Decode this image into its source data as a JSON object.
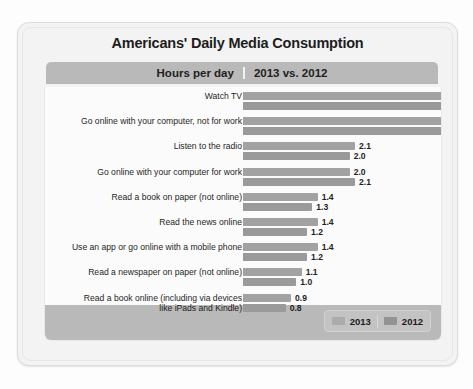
{
  "title": "Americans' Daily Media Consumption",
  "subtitle": {
    "left": "Hours per day",
    "right": "2013 vs. 2012"
  },
  "legend": {
    "series_2013": "2013",
    "series_2012": "2012"
  },
  "chart_data": {
    "type": "bar",
    "orientation": "horizontal",
    "title": "Americans' Daily Media Consumption",
    "subtitle": "Hours per day  |  2013 vs. 2012",
    "xlabel": "Hours per day",
    "ylabel": "",
    "xlim": [
      0,
      3.9
    ],
    "grid": false,
    "legend_position": "bottom-right",
    "categories": [
      "Watch TV",
      "Go online with your computer, not for work",
      "Listen to the radio",
      "Go online with your computer for work",
      "Read a book on paper (not online)",
      "Read the news online",
      "Use an app or go online with a mobile phone",
      "Read a newspaper on paper (not online)",
      "Read a book online (including via devices like iPads and Kindle)"
    ],
    "series": [
      {
        "name": "2013",
        "values": [
          3.9,
          3.8,
          2.1,
          2.0,
          1.4,
          1.4,
          1.4,
          1.1,
          0.9
        ]
      },
      {
        "name": "2012",
        "values": [
          3.9,
          3.8,
          2.0,
          2.1,
          1.3,
          1.2,
          1.2,
          1.0,
          0.8
        ]
      }
    ],
    "value_labels": [
      [
        "3.9",
        "3.9"
      ],
      [
        "3.8",
        "3.8"
      ],
      [
        "2.1",
        "2.0"
      ],
      [
        "2.0",
        "2.1"
      ],
      [
        "1.4",
        "1.3"
      ],
      [
        "1.4",
        "1.2"
      ],
      [
        "1.4",
        "1.2"
      ],
      [
        "1.1",
        "1.0"
      ],
      [
        "0.9",
        "0.8"
      ]
    ]
  },
  "colors": {
    "bar_2013": "#a2a2a2",
    "bar_2012": "#9a9a9a",
    "band": "#b9b9b9",
    "card": "#f3f3f3"
  },
  "rows": [
    {
      "label": "Watch TV",
      "label2": "",
      "v2013": "3.9",
      "v2012": "3.9"
    },
    {
      "label": "Go online with your computer, not for work",
      "label2": "",
      "v2013": "3.8",
      "v2012": "3.8"
    },
    {
      "label": "Listen to the radio",
      "label2": "",
      "v2013": "2.1",
      "v2012": "2.0"
    },
    {
      "label": "Go online with your computer for work",
      "label2": "",
      "v2013": "2.0",
      "v2012": "2.1"
    },
    {
      "label": "Read a book on paper (not online)",
      "label2": "",
      "v2013": "1.4",
      "v2012": "1.3"
    },
    {
      "label": "Read the news online",
      "label2": "",
      "v2013": "1.4",
      "v2012": "1.2"
    },
    {
      "label": "Use an app or go online with a mobile phone",
      "label2": "",
      "v2013": "1.4",
      "v2012": "1.2"
    },
    {
      "label": "Read a newspaper on paper (not online)",
      "label2": "",
      "v2013": "1.1",
      "v2012": "1.0"
    },
    {
      "label": "Read a book online (including via devices",
      "label2": "like iPads and Kindle)",
      "v2013": "0.9",
      "v2012": "0.8"
    }
  ]
}
